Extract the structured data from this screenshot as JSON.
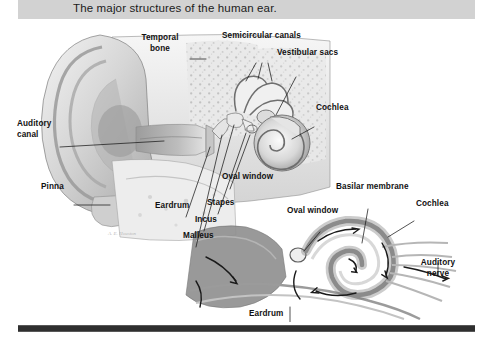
{
  "caption": {
    "text": "The major structures of the human ear."
  },
  "figure": {
    "alt_name": "human-ear-anatomy-diagram",
    "signature": "A. E. Houston",
    "labels": [
      {
        "id": "temporal-bone",
        "text": "Temporal\nbone",
        "x": 159,
        "y": 33,
        "align": "center"
      },
      {
        "id": "semicircular-canals",
        "text": "Semicircular canals",
        "x": 225,
        "y": 31,
        "align": "left"
      },
      {
        "id": "vestibular-sacs",
        "text": "Vestibular sacs",
        "x": 277,
        "y": 48,
        "align": "left"
      },
      {
        "id": "cochlea-upper",
        "text": "Cochlea",
        "x": 317,
        "y": 108,
        "align": "left"
      },
      {
        "id": "auditory-canal",
        "text": "Auditory\ncanal",
        "x": 18,
        "y": 120,
        "align": "left"
      },
      {
        "id": "pinna",
        "text": "Pinna",
        "x": 42,
        "y": 183,
        "align": "left"
      },
      {
        "id": "oval-window-upper",
        "text": "Oval window",
        "x": 222,
        "y": 173,
        "align": "left"
      },
      {
        "id": "eardrum-upper",
        "text": "Eardrum",
        "x": 156,
        "y": 202,
        "align": "left"
      },
      {
        "id": "stapes",
        "text": "Stapes",
        "x": 208,
        "y": 199,
        "align": "left"
      },
      {
        "id": "incus",
        "text": "Incus",
        "x": 196,
        "y": 216,
        "align": "left"
      },
      {
        "id": "malleus",
        "text": "Malleus",
        "x": 184,
        "y": 232,
        "align": "left"
      },
      {
        "id": "basilar-membrane",
        "text": "Basilar membrane",
        "x": 337,
        "y": 183,
        "align": "left"
      },
      {
        "id": "cochlea-lower",
        "text": "Cochlea",
        "x": 417,
        "y": 200,
        "align": "left"
      },
      {
        "id": "oval-window-lower",
        "text": "Oval window",
        "x": 288,
        "y": 207,
        "align": "left"
      },
      {
        "id": "auditory-nerve",
        "text": "Auditory\nnerve",
        "x": 425,
        "y": 258,
        "align": "left"
      },
      {
        "id": "eardrum-lower",
        "text": "Eardrum",
        "x": 250,
        "y": 310,
        "align": "left"
      }
    ]
  },
  "colors": {
    "caption_bar": "#d2d2d2",
    "caption_text": "#1b1b1b",
    "label_text": "#111111",
    "rule": "#2f2f2f",
    "page_background": "#ffffff",
    "art_light": "#efefef",
    "art_mid": "#c4c4c4",
    "art_dark": "#8d8d8d",
    "art_outline": "#5a5a5a"
  }
}
